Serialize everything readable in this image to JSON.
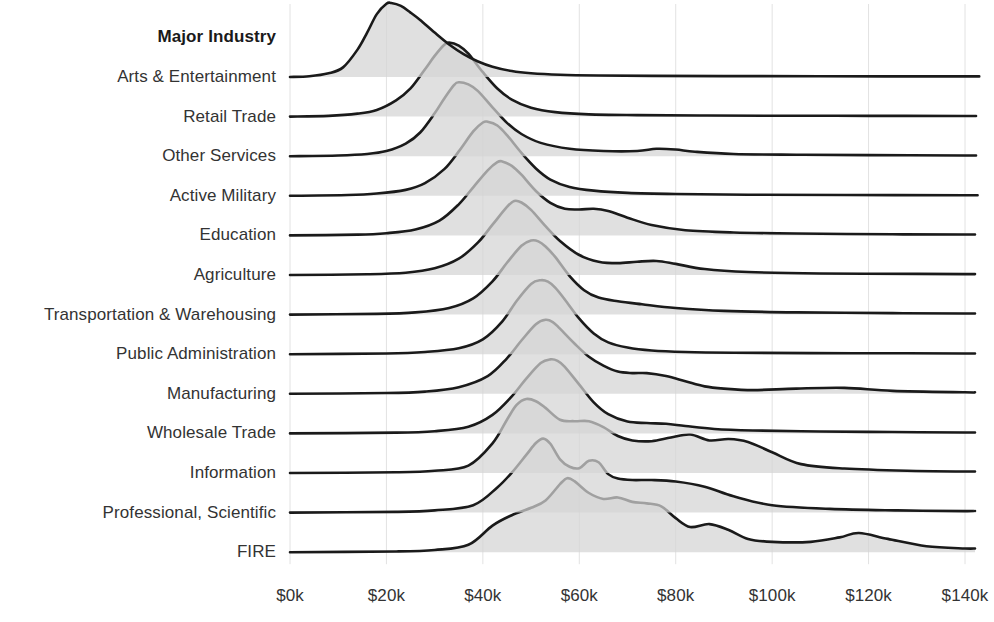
{
  "chart_data": {
    "type": "area",
    "variant": "ridgeline",
    "title": "",
    "xlabel": "",
    "ylabel": "Major Industry",
    "legend": "none",
    "grid": "vertical-only",
    "xlim": [
      0,
      140000
    ],
    "xtick_values": [
      0,
      20000,
      40000,
      60000,
      80000,
      100000,
      120000,
      140000
    ],
    "xtick_labels": [
      "$0k",
      "$20k",
      "$40k",
      "$60k",
      "$80k",
      "$100k",
      "$120k",
      "$140k"
    ],
    "categories": [
      "Arts & Entertainment",
      "Retail Trade",
      "Other Services",
      "Active Military",
      "Education",
      "Agriculture",
      "Transportation & Warehousing",
      "Public Administration",
      "Manufacturing",
      "Wholesale Trade",
      "Information",
      "Professional, Scientific",
      "FIRE"
    ],
    "colors": {
      "fill": "#d4d4d4",
      "stroke": "#1a1a1a",
      "gridline": "#e2e2e2",
      "text": "#333333",
      "title_text": "#1a1a1a",
      "background": "#ffffff"
    },
    "series": [
      {
        "name": "Arts & Entertainment",
        "peak_x": 21000,
        "peak_height": 1.0,
        "density_x": [
          0,
          4000,
          8000,
          11000,
          14000,
          16000,
          18000,
          20000,
          21000,
          23000,
          25000,
          27000,
          30000,
          33000,
          36000,
          39000,
          42000,
          46000,
          50000,
          56000,
          64000,
          75000,
          90000,
          110000,
          140000
        ],
        "density_y": [
          0.0,
          0.01,
          0.05,
          0.13,
          0.37,
          0.6,
          0.85,
          0.99,
          1.0,
          0.96,
          0.87,
          0.77,
          0.6,
          0.44,
          0.31,
          0.21,
          0.14,
          0.08,
          0.05,
          0.03,
          0.02,
          0.015,
          0.012,
          0.01,
          0.008
        ]
      },
      {
        "name": "Retail Trade",
        "peak_x": 33000,
        "peak_height": 1.0,
        "density_x": [
          0,
          8000,
          14000,
          18000,
          22000,
          25000,
          28000,
          30000,
          32000,
          33000,
          35000,
          37000,
          40000,
          43000,
          46000,
          50000,
          55000,
          62000,
          72000,
          85000,
          100000,
          120000,
          140000
        ],
        "density_y": [
          0.0,
          0.01,
          0.04,
          0.09,
          0.22,
          0.38,
          0.64,
          0.82,
          0.97,
          1.0,
          0.96,
          0.85,
          0.6,
          0.38,
          0.23,
          0.12,
          0.06,
          0.03,
          0.02,
          0.015,
          0.012,
          0.01,
          0.008
        ]
      },
      {
        "name": "Other Services",
        "peak_x": 35000,
        "peak_height": 1.0,
        "density_x": [
          0,
          10000,
          16000,
          20000,
          24000,
          27000,
          30000,
          32000,
          34000,
          35000,
          37000,
          39000,
          42000,
          45000,
          48000,
          52000,
          58000,
          65000,
          72000,
          76000,
          80000,
          84000,
          92000,
          105000,
          120000,
          140000
        ],
        "density_y": [
          0.0,
          0.01,
          0.03,
          0.07,
          0.17,
          0.32,
          0.58,
          0.78,
          0.96,
          1.0,
          0.97,
          0.88,
          0.66,
          0.45,
          0.3,
          0.18,
          0.1,
          0.07,
          0.07,
          0.1,
          0.09,
          0.06,
          0.03,
          0.02,
          0.015,
          0.01
        ]
      },
      {
        "name": "Active Military",
        "peak_x": 41000,
        "peak_height": 1.0,
        "density_x": [
          0,
          12000,
          18000,
          24000,
          28000,
          32000,
          35000,
          38000,
          40000,
          41000,
          43000,
          45000,
          48000,
          51000,
          54000,
          58000,
          63000,
          70000,
          80000,
          95000,
          115000,
          140000
        ],
        "density_y": [
          0.0,
          0.01,
          0.03,
          0.08,
          0.17,
          0.36,
          0.6,
          0.87,
          0.99,
          1.0,
          0.95,
          0.82,
          0.58,
          0.37,
          0.22,
          0.12,
          0.07,
          0.04,
          0.025,
          0.015,
          0.01,
          0.008
        ]
      },
      {
        "name": "Education",
        "peak_x": 44000,
        "peak_height": 1.0,
        "density_x": [
          0,
          14000,
          20000,
          26000,
          31000,
          35000,
          38000,
          41000,
          43000,
          44000,
          46000,
          48000,
          51000,
          54000,
          57000,
          60000,
          63000,
          66000,
          70000,
          75000,
          82000,
          92000,
          105000,
          125000,
          140000
        ],
        "density_y": [
          0.0,
          0.01,
          0.03,
          0.08,
          0.2,
          0.42,
          0.65,
          0.88,
          0.99,
          1.0,
          0.94,
          0.82,
          0.6,
          0.44,
          0.36,
          0.35,
          0.36,
          0.33,
          0.24,
          0.14,
          0.07,
          0.04,
          0.025,
          0.015,
          0.012
        ]
      },
      {
        "name": "Agriculture",
        "peak_x": 47000,
        "peak_height": 1.0,
        "density_x": [
          0,
          16000,
          24000,
          30000,
          35000,
          39000,
          42000,
          45000,
          46500,
          48000,
          50000,
          53000,
          56000,
          60000,
          64000,
          68000,
          72000,
          76000,
          80000,
          86000,
          95000,
          110000,
          130000,
          140000
        ],
        "density_y": [
          0.0,
          0.01,
          0.03,
          0.09,
          0.22,
          0.44,
          0.68,
          0.92,
          1.0,
          0.98,
          0.88,
          0.66,
          0.46,
          0.27,
          0.18,
          0.16,
          0.18,
          0.19,
          0.15,
          0.08,
          0.04,
          0.02,
          0.015,
          0.012
        ]
      },
      {
        "name": "Transportation & Warehousing",
        "peak_x": 50000,
        "peak_height": 1.0,
        "density_x": [
          0,
          18000,
          26000,
          33000,
          38000,
          42000,
          45000,
          48000,
          50000,
          51500,
          53000,
          55000,
          58000,
          61000,
          64000,
          68000,
          73000,
          80000,
          90000,
          105000,
          125000,
          140000
        ],
        "density_y": [
          0.0,
          0.01,
          0.03,
          0.09,
          0.22,
          0.45,
          0.7,
          0.93,
          1.0,
          0.99,
          0.92,
          0.78,
          0.52,
          0.33,
          0.23,
          0.18,
          0.14,
          0.09,
          0.05,
          0.03,
          0.02,
          0.015
        ]
      },
      {
        "name": "Public Administration",
        "peak_x": 52000,
        "peak_height": 1.0,
        "density_x": [
          0,
          20000,
          28000,
          35000,
          40000,
          44000,
          47000,
          50000,
          52000,
          53500,
          55000,
          57000,
          60000,
          63000,
          66000,
          70000,
          75000,
          82000,
          92000,
          108000,
          128000,
          140000
        ],
        "density_y": [
          0.0,
          0.01,
          0.03,
          0.08,
          0.2,
          0.44,
          0.72,
          0.95,
          1.0,
          0.98,
          0.9,
          0.74,
          0.48,
          0.28,
          0.16,
          0.09,
          0.05,
          0.03,
          0.02,
          0.015,
          0.012,
          0.01
        ]
      },
      {
        "name": "Manufacturing",
        "peak_x": 53000,
        "peak_height": 1.0,
        "density_x": [
          0,
          20000,
          28000,
          35000,
          41000,
          45000,
          48000,
          51000,
          53000,
          54500,
          56000,
          59000,
          62000,
          65000,
          68000,
          71000,
          74000,
          78000,
          82000,
          86000,
          90000,
          96000,
          105000,
          115000,
          125000,
          140000
        ],
        "density_y": [
          0.0,
          0.01,
          0.03,
          0.09,
          0.24,
          0.48,
          0.72,
          0.94,
          1.0,
          0.97,
          0.88,
          0.68,
          0.5,
          0.38,
          0.3,
          0.28,
          0.28,
          0.24,
          0.17,
          0.1,
          0.07,
          0.05,
          0.07,
          0.08,
          0.04,
          0.02
        ]
      },
      {
        "name": "Wholesale Trade",
        "peak_x": 54000,
        "peak_height": 1.0,
        "density_x": [
          0,
          22000,
          30000,
          37000,
          42000,
          46000,
          49000,
          52000,
          54000,
          55500,
          57000,
          60000,
          63000,
          66000,
          70000,
          74000,
          78000,
          82000,
          88000,
          96000,
          110000,
          125000,
          140000
        ],
        "density_y": [
          0.0,
          0.01,
          0.03,
          0.09,
          0.25,
          0.5,
          0.74,
          0.95,
          1.0,
          0.98,
          0.9,
          0.66,
          0.42,
          0.26,
          0.16,
          0.14,
          0.13,
          0.1,
          0.06,
          0.04,
          0.025,
          0.018,
          0.012
        ]
      },
      {
        "name": "Information",
        "peak_x": 49000,
        "peak_height": 1.0,
        "density_x": [
          0,
          22000,
          30000,
          37000,
          42000,
          45000,
          47000,
          49000,
          51000,
          53000,
          56000,
          59000,
          62000,
          65000,
          68000,
          71000,
          75000,
          79000,
          83000,
          87000,
          91000,
          95000,
          100000,
          106000,
          115000,
          128000,
          140000
        ],
        "density_y": [
          0.0,
          0.01,
          0.03,
          0.1,
          0.4,
          0.72,
          0.92,
          1.0,
          0.97,
          0.88,
          0.72,
          0.7,
          0.7,
          0.62,
          0.5,
          0.44,
          0.43,
          0.48,
          0.52,
          0.44,
          0.46,
          0.42,
          0.28,
          0.12,
          0.06,
          0.03,
          0.02
        ]
      },
      {
        "name": "Professional, Scientific",
        "peak_x": 52000,
        "peak_height": 1.0,
        "density_x": [
          0,
          22000,
          30000,
          38000,
          43000,
          46000,
          49000,
          51000,
          52500,
          54000,
          56000,
          58000,
          60000,
          62000,
          64000,
          66000,
          68000,
          71000,
          75000,
          80000,
          86000,
          92000,
          100000,
          112000,
          126000,
          140000
        ],
        "density_y": [
          0.0,
          0.01,
          0.03,
          0.1,
          0.34,
          0.54,
          0.78,
          0.94,
          1.0,
          0.93,
          0.72,
          0.62,
          0.6,
          0.7,
          0.68,
          0.52,
          0.46,
          0.44,
          0.44,
          0.42,
          0.35,
          0.22,
          0.1,
          0.05,
          0.03,
          0.02
        ]
      },
      {
        "name": "FIRE",
        "peak_x": 57000,
        "peak_height": 1.0,
        "density_x": [
          0,
          22000,
          30000,
          37000,
          42000,
          46000,
          50000,
          53000,
          56000,
          57500,
          59000,
          62000,
          65000,
          68000,
          71000,
          74000,
          77000,
          80000,
          83000,
          87000,
          91000,
          95000,
          100000,
          108000,
          114000,
          118000,
          124000,
          132000,
          140000
        ],
        "density_y": [
          0.0,
          0.01,
          0.03,
          0.1,
          0.36,
          0.5,
          0.6,
          0.7,
          0.92,
          1.0,
          0.96,
          0.8,
          0.72,
          0.74,
          0.68,
          0.66,
          0.62,
          0.46,
          0.34,
          0.38,
          0.3,
          0.18,
          0.14,
          0.14,
          0.2,
          0.26,
          0.18,
          0.08,
          0.05
        ]
      }
    ]
  },
  "axis": {
    "y_axis_title": "Major Industry"
  }
}
